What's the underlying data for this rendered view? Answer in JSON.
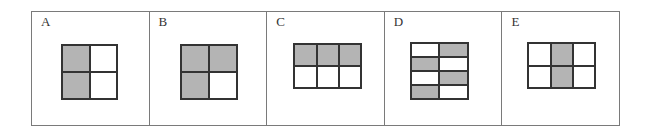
{
  "colors": {
    "border": "#7a7a7a",
    "grid_line": "#333333",
    "filled": "#b4b4b4",
    "empty": "#ffffff"
  },
  "panels": [
    {
      "label": "A",
      "rows": 2,
      "cols": 2,
      "cells": [
        [
          1,
          0
        ],
        [
          1,
          0
        ]
      ],
      "box": {
        "left": 29,
        "top": 32,
        "width": 57,
        "height": 56
      }
    },
    {
      "label": "B",
      "rows": 2,
      "cols": 2,
      "cells": [
        [
          1,
          1
        ],
        [
          1,
          0
        ]
      ],
      "box": {
        "left": 30,
        "top": 32,
        "width": 58,
        "height": 56
      }
    },
    {
      "label": "C",
      "rows": 2,
      "cols": 3,
      "cells": [
        [
          1,
          1,
          1
        ],
        [
          0,
          0,
          0
        ]
      ],
      "box": {
        "left": 26,
        "top": 31,
        "width": 69,
        "height": 46
      }
    },
    {
      "label": "D",
      "rows": 4,
      "cols": 2,
      "cells": [
        [
          0,
          1
        ],
        [
          1,
          0
        ],
        [
          0,
          1
        ],
        [
          1,
          0
        ]
      ],
      "box": {
        "left": 25,
        "top": 30,
        "width": 59,
        "height": 58
      }
    },
    {
      "label": "E",
      "rows": 2,
      "cols": 3,
      "cells": [
        [
          0,
          1,
          0
        ],
        [
          0,
          1,
          0
        ]
      ],
      "box": {
        "left": 25,
        "top": 30,
        "width": 69,
        "height": 47
      }
    }
  ]
}
